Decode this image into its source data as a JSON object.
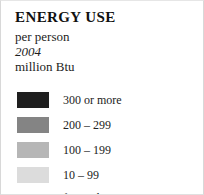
{
  "legend": {
    "title": "ENERGY USE",
    "subtitle_lines": [
      {
        "text": "per person",
        "style": "normal"
      },
      {
        "text": "2004",
        "style": "italic"
      },
      {
        "text": "million Btu",
        "style": "normal"
      }
    ],
    "classes": [
      {
        "label": "300 or more",
        "color": "#1f1f1f"
      },
      {
        "label": "200 – 299",
        "color": "#848484"
      },
      {
        "label": "100 – 199",
        "color": "#b6b6b6"
      },
      {
        "label": "10 – 99",
        "color": "#dcdcdc"
      }
    ],
    "footnote": "fewer than 10"
  }
}
